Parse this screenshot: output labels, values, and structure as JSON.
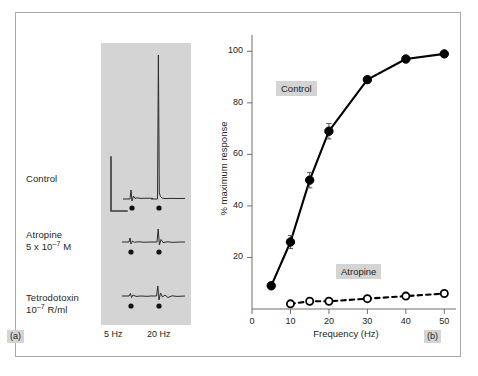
{
  "figure": {
    "panel_a_tag": "(a)",
    "panel_b_tag": "(b)"
  },
  "panel_a": {
    "row_labels": [
      {
        "line1": "Control",
        "line2": ""
      },
      {
        "line1": "Atropine",
        "line2": "5 x 10",
        "exp": "–7",
        "line2_tail": " M"
      },
      {
        "line1": "Tetrodotoxin",
        "line2": "10",
        "exp": "–7",
        "line2_tail": " R/ml"
      }
    ],
    "control_label": "Control",
    "atropine_label_line1": "Atropine",
    "atropine_label_line2_pre": "5 x 10",
    "atropine_label_exp": "–7",
    "atropine_label_line2_post": " M",
    "ttx_label_line1": "Tetrodotoxin",
    "ttx_label_line2_pre": "10",
    "ttx_label_exp": "–7",
    "ttx_label_line2_post": " R/ml",
    "freq_left": "5 Hz",
    "freq_right": "20 Hz",
    "trace_panel_bg": "#d4d4d4"
  },
  "chart_data": {
    "type": "line",
    "title": "",
    "xlabel": "Frequency (Hz)",
    "ylabel": "% maximum response",
    "xlim": [
      0,
      52
    ],
    "ylim": [
      0,
      104
    ],
    "xticks": [
      0,
      10,
      20,
      30,
      40,
      50
    ],
    "xtick_labels": [
      "0",
      "10",
      "20",
      "30",
      "40",
      "50"
    ],
    "yticks": [
      20,
      40,
      60,
      80,
      100
    ],
    "ytick_labels": [
      "20",
      "40",
      "60",
      "80",
      "100"
    ],
    "grid": false,
    "legend": "inline-labels",
    "series": [
      {
        "name": "Control",
        "marker": "filled-circle",
        "linestyle": "solid",
        "color": "#000000",
        "x": [
          5,
          10,
          15,
          20,
          30,
          40,
          50
        ],
        "values": [
          9,
          26,
          50,
          69,
          89,
          97,
          99
        ],
        "errors": [
          0,
          2.5,
          3,
          3,
          0,
          0,
          0
        ]
      },
      {
        "name": "Atropine",
        "marker": "open-circle",
        "linestyle": "dashed",
        "color": "#000000",
        "x": [
          10,
          15,
          20,
          30,
          40,
          50
        ],
        "values": [
          2,
          3,
          3,
          4,
          5,
          6
        ],
        "errors": [
          0,
          0,
          0,
          0,
          0,
          0
        ]
      }
    ]
  },
  "colors": {
    "frame_border": "#a8a8a8",
    "gray_panel": "#d4d4d4",
    "ink": "#231f20",
    "page_bg": "#ffffff"
  }
}
